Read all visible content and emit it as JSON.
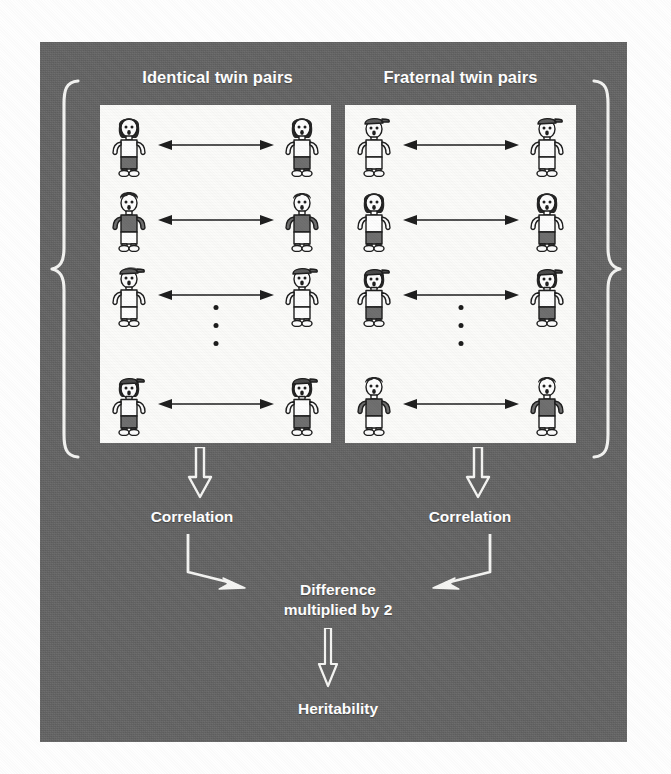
{
  "figure": {
    "background_color": "#636363",
    "panel_color": "#636363",
    "box_color": "#fbfbf9",
    "text_color": "#ffffff"
  },
  "columns": [
    {
      "id": "identical",
      "heading": "Identical twin pairs",
      "brace": "{",
      "rows": [
        {
          "left": "girl-dark-hair-white-shirt",
          "right": "girl-dark-hair-white-shirt",
          "connector": "double-headed-arrow"
        },
        {
          "left": "boy-dark-hair-dark-shirt",
          "right": "boy-dark-hair-dark-shirt",
          "connector": "double-headed-arrow"
        },
        {
          "left": "boy-cap-white-shirt",
          "right": "boy-cap-white-shirt",
          "connector": "double-headed-arrow"
        },
        {
          "left": "girl-cap-white-shirt",
          "right": "girl-cap-white-shirt",
          "connector": "double-headed-arrow"
        }
      ],
      "ellipsis_dots": 3
    },
    {
      "id": "fraternal",
      "heading": "Fraternal twin pairs",
      "brace": "}",
      "rows": [
        {
          "left": "boy-cap-white-shirt",
          "right": "boy-cap-white-shirt",
          "connector": "double-headed-arrow"
        },
        {
          "left": "girl-dark-hair-white-shirt",
          "right": "girl-dark-hair-white-shirt",
          "connector": "double-headed-arrow"
        },
        {
          "left": "girl-cap-dark-pants",
          "right": "girl-cap-dark-pants",
          "connector": "double-headed-arrow"
        },
        {
          "left": "boy-dark-hair-dark-shirt",
          "right": "boy-dark-hair-dark-shirt",
          "connector": "double-headed-arrow"
        }
      ],
      "ellipsis_dots": 3
    }
  ],
  "flow": {
    "correlation_left": "Correlation",
    "correlation_right": "Correlation",
    "difference": "Difference\nmultiplied by 2",
    "difference_line1": "Difference",
    "difference_line2": "multiplied by 2",
    "heritability": "Heritability",
    "arrows": [
      {
        "name": "arrow-box-to-correlation-left",
        "direction": "down"
      },
      {
        "name": "arrow-box-to-correlation-right",
        "direction": "down"
      },
      {
        "name": "arrow-correlation-left-to-difference",
        "direction": "down-right"
      },
      {
        "name": "arrow-correlation-right-to-difference",
        "direction": "down-left"
      },
      {
        "name": "arrow-difference-to-heritability",
        "direction": "down"
      }
    ]
  }
}
